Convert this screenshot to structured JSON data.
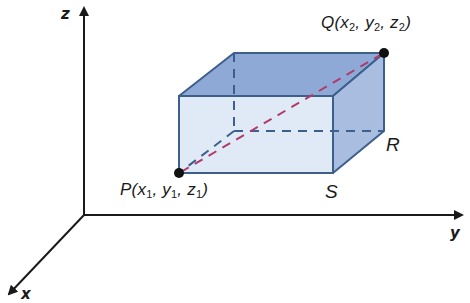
{
  "diagram": {
    "type": "3d-coordinate-box",
    "axes": {
      "z": {
        "label": "z"
      },
      "y": {
        "label": "y"
      },
      "x": {
        "label": "x"
      }
    },
    "points": {
      "P": {
        "name": "P",
        "coords": [
          "x",
          "1",
          "y",
          "1",
          "z",
          "1"
        ]
      },
      "Q": {
        "name": "Q",
        "coords": [
          "x",
          "2",
          "y",
          "2",
          "z",
          "2"
        ]
      }
    },
    "vertices": {
      "R": "R",
      "S": "S"
    },
    "colors": {
      "axis": "#1a1a1a",
      "box_edge": "#3d5f8c",
      "front_face": "#dde8f5",
      "top_face": "#8fa9d6",
      "side_face": "#a9bde0",
      "hidden_edge": "#3d5f8c",
      "diagonal": "#b03a6a",
      "point": "#111111"
    }
  }
}
